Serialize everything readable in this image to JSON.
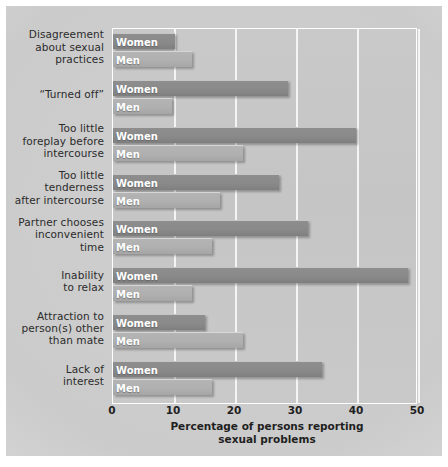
{
  "chart_data": {
    "type": "bar",
    "orientation": "horizontal",
    "title": "",
    "xlabel": "Percentage of persons reporting sexual problems",
    "ylabel": "",
    "xlim": [
      0,
      50
    ],
    "xticks": [
      0,
      10,
      20,
      30,
      40,
      50
    ],
    "grid": true,
    "legend": "inline bar labels",
    "categories": [
      "Disagreement about sexual practices",
      "“Turned off”",
      "Too little foreplay before intercourse",
      "Too little tenderness after intercourse",
      "Partner chooses inconvenient time",
      "Inability to relax",
      "Attraction to person(s) other than mate",
      "Lack of interest"
    ],
    "series": [
      {
        "name": "Women",
        "color": "#8a8a8a",
        "values": [
          10.2,
          28.7,
          39.8,
          27.2,
          31.9,
          48.4,
          15.0,
          34.2
        ]
      },
      {
        "name": "Men",
        "color": "#b0b0b0",
        "values": [
          12.9,
          9.6,
          21.3,
          17.5,
          16.3,
          12.9,
          21.3,
          16.3
        ]
      }
    ]
  },
  "axis": {
    "xlabel_line1": "Percentage of persons reporting",
    "xlabel_line2": "sexual problems",
    "tick_labels": [
      "0",
      "10",
      "20",
      "30",
      "40",
      "50"
    ]
  },
  "categories_display": [
    [
      "Disagreement",
      "about sexual",
      "practices"
    ],
    [
      "“Turned off”"
    ],
    [
      "Too little",
      "foreplay before",
      "intercourse"
    ],
    [
      "Too little",
      "tenderness",
      "after intercourse"
    ],
    [
      "Partner chooses",
      "inconvenient",
      "time"
    ],
    [
      "Inability",
      "to relax"
    ],
    [
      "Attraction to",
      "person(s) other",
      "than mate"
    ],
    [
      "Lack of",
      "interest"
    ]
  ],
  "series_labels": {
    "women": "Women",
    "men": "Men"
  },
  "colors": {
    "women_bar": "#8a8a8a",
    "men_bar": "#b0b0b0",
    "plot_background": "#c7c7c7",
    "panel_background": "#cccccc",
    "gridline": "#f4f4f4",
    "text": "#1f1f1f",
    "bar_label_text": "#ffffff"
  }
}
